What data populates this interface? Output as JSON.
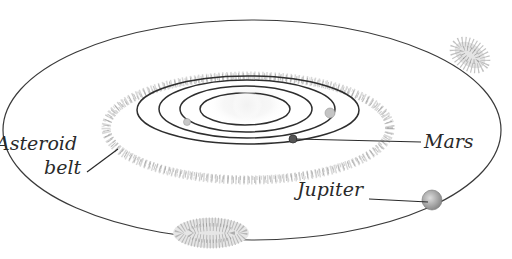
{
  "diagram": {
    "title": "",
    "labels": {
      "asteroid": "Asteroid",
      "belt": "belt",
      "mars": "Mars",
      "jupiter": "Jupiter"
    },
    "nodes": [
      {
        "id": "sun",
        "type": "star"
      },
      {
        "id": "orbit-1",
        "type": "orbit"
      },
      {
        "id": "orbit-2",
        "type": "orbit"
      },
      {
        "id": "orbit-3",
        "type": "orbit"
      },
      {
        "id": "orbit-mars",
        "type": "orbit"
      },
      {
        "id": "asteroid-belt",
        "type": "belt",
        "label": "Asteroid belt"
      },
      {
        "id": "orbit-jupiter",
        "type": "orbit"
      },
      {
        "id": "mars",
        "type": "planet",
        "label": "Mars"
      },
      {
        "id": "jupiter",
        "type": "planet",
        "label": "Jupiter"
      },
      {
        "id": "trojans-leading",
        "type": "asteroid-cluster"
      },
      {
        "id": "trojans-trailing",
        "type": "asteroid-cluster"
      }
    ],
    "colors": {
      "orbit_line": "#3a3a3a",
      "belt_speckle": "#9a9a9a",
      "label_text": "#2a2a2a",
      "background": "#ffffff"
    }
  }
}
